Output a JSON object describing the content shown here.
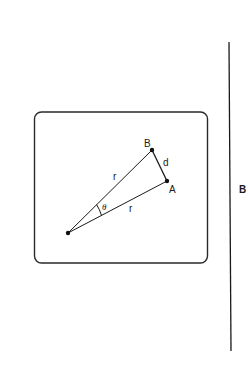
{
  "diagram": {
    "frame": {
      "x": 34,
      "y": 112,
      "width": 173,
      "height": 151,
      "radius": 7,
      "stroke": "#2a2a2a"
    },
    "points": {
      "origin": {
        "x": 68,
        "y": 233
      },
      "B": {
        "x": 152,
        "y": 150
      },
      "A": {
        "x": 167,
        "y": 181
      }
    },
    "labels": {
      "point_b": {
        "text": "B",
        "x": 144,
        "y": 147
      },
      "point_a": {
        "text": "A",
        "x": 169,
        "y": 193
      },
      "distance_d": {
        "text": "d",
        "x": 163,
        "y": 166
      },
      "radius_upper": {
        "text": "r",
        "x": 113,
        "y": 180
      },
      "radius_lower": {
        "text": "r",
        "x": 129,
        "y": 212
      },
      "angle_theta": {
        "text": "θ",
        "x": 102,
        "y": 210
      },
      "barrier_b": {
        "text": "B",
        "x": 239,
        "y": 193
      }
    },
    "barrier_line": {
      "x1": 229,
      "y1": 42,
      "x2": 231,
      "y2": 351
    },
    "stroke_color": "#1a1a1a"
  }
}
